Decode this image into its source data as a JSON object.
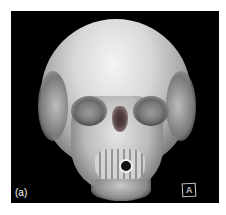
{
  "figure": {
    "panel_label": "(a)",
    "orientation_marker": "A",
    "background_color": "#000000",
    "bone_color": "#e0e0e0"
  }
}
